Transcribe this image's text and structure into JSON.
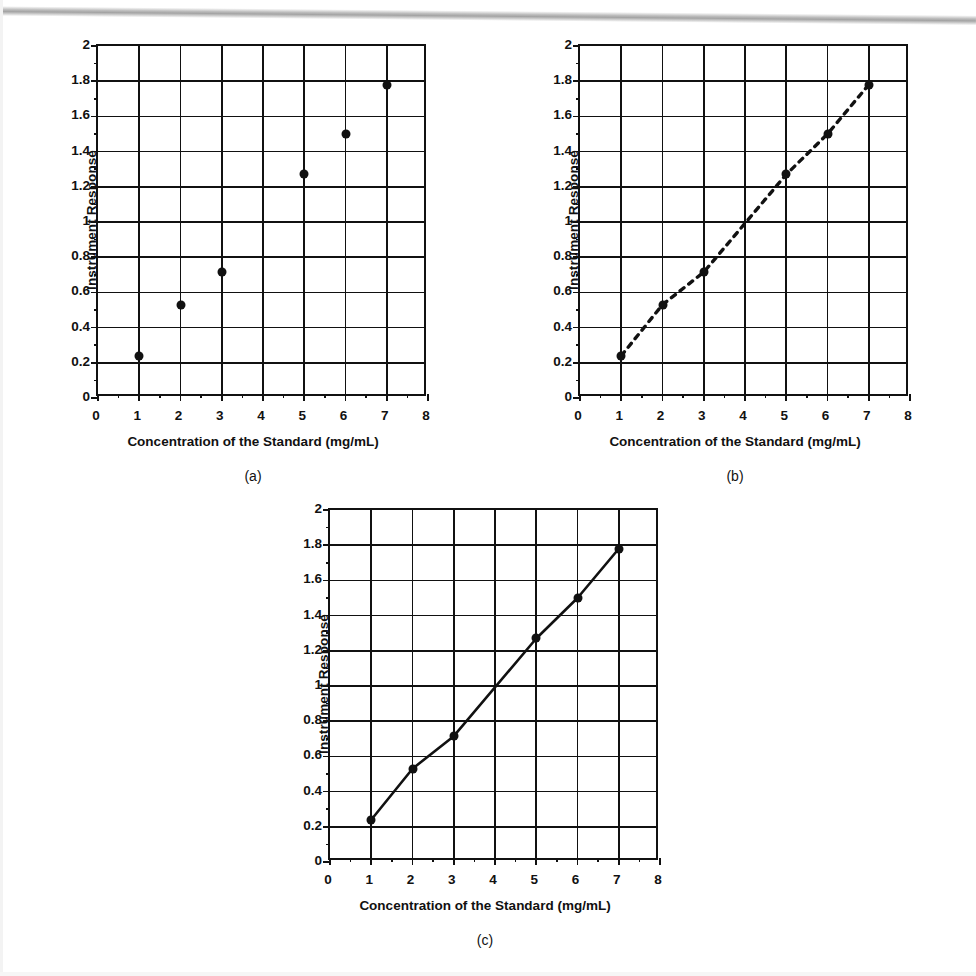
{
  "figure": {
    "background_color": "#ffffff",
    "ink_color": "#111111",
    "scan_artifact": "gray-streak-top"
  },
  "chart_data": [
    {
      "id": "a",
      "type": "scatter",
      "caption": "(a)",
      "title": "",
      "xlabel": "Concentration of the Standard (mg/mL)",
      "ylabel": "Instrument Response",
      "xlim": [
        0,
        8
      ],
      "ylim": [
        0,
        2
      ],
      "xticks": [
        0,
        1,
        2,
        3,
        4,
        5,
        6,
        7,
        8
      ],
      "xtick_labels": [
        "0",
        "1",
        "2",
        "3",
        "4",
        "5",
        "6",
        "7",
        "8"
      ],
      "x_minor_step": 0.5,
      "yticks": [
        0,
        0.2,
        0.4,
        0.6,
        0.8,
        1,
        1.2,
        1.4,
        1.6,
        1.8,
        2
      ],
      "ytick_labels": [
        "0",
        "0.2",
        "0.4",
        "0.6",
        "0.8",
        "1",
        "1.2",
        "1.4",
        "1.6",
        "1.8",
        "2"
      ],
      "y_minor_step": 0.1,
      "grid": true,
      "legend": "none",
      "series": [
        {
          "name": "Standards",
          "marker": "filled-circle",
          "line": "none",
          "x": [
            1,
            2,
            3,
            5,
            6,
            7
          ],
          "y": [
            0.24,
            0.53,
            0.715,
            1.27,
            1.5,
            1.78
          ]
        }
      ]
    },
    {
      "id": "b",
      "type": "scatter",
      "caption": "(b)",
      "title": "",
      "xlabel": "Concentration of the Standard (mg/mL)",
      "ylabel": "Instrument Response",
      "xlim": [
        0,
        8
      ],
      "ylim": [
        0,
        2
      ],
      "xticks": [
        0,
        1,
        2,
        3,
        4,
        5,
        6,
        7,
        8
      ],
      "xtick_labels": [
        "0",
        "1",
        "2",
        "3",
        "4",
        "5",
        "6",
        "7",
        "8"
      ],
      "x_minor_step": 0.5,
      "yticks": [
        0,
        0.2,
        0.4,
        0.6,
        0.8,
        1,
        1.2,
        1.4,
        1.6,
        1.8,
        2
      ],
      "ytick_labels": [
        "0",
        "0.2",
        "0.4",
        "0.6",
        "0.8",
        "1",
        "1.2",
        "1.4",
        "1.6",
        "1.8",
        "2"
      ],
      "y_minor_step": 0.1,
      "grid": true,
      "legend": "none",
      "series": [
        {
          "name": "Standards",
          "marker": "filled-circle",
          "line": "dashed",
          "x": [
            1,
            2,
            3,
            5,
            6,
            7
          ],
          "y": [
            0.24,
            0.53,
            0.715,
            1.27,
            1.5,
            1.78
          ]
        }
      ]
    },
    {
      "id": "c",
      "type": "line",
      "caption": "(c)",
      "title": "",
      "xlabel": "Concentration of the Standard (mg/mL)",
      "ylabel": "Instrument Response",
      "xlim": [
        0,
        8
      ],
      "ylim": [
        0,
        2
      ],
      "xticks": [
        0,
        1,
        2,
        3,
        4,
        5,
        6,
        7,
        8
      ],
      "xtick_labels": [
        "0",
        "1",
        "2",
        "3",
        "4",
        "5",
        "6",
        "7",
        "8"
      ],
      "x_minor_step": 0.5,
      "yticks": [
        0,
        0.2,
        0.4,
        0.6,
        0.8,
        1,
        1.2,
        1.4,
        1.6,
        1.8,
        2
      ],
      "ytick_labels": [
        "0",
        "0.2",
        "0.4",
        "0.6",
        "0.8",
        "1",
        "1.2",
        "1.4",
        "1.6",
        "1.8",
        "2"
      ],
      "y_minor_step": 0.1,
      "grid": true,
      "legend": "none",
      "series": [
        {
          "name": "Standards",
          "marker": "filled-circle",
          "line": "solid",
          "x": [
            1,
            2,
            3,
            5,
            6,
            7
          ],
          "y": [
            0.24,
            0.53,
            0.715,
            1.27,
            1.5,
            1.78
          ]
        }
      ]
    }
  ]
}
